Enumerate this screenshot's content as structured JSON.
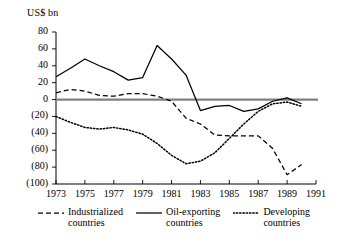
{
  "chart_data": {
    "type": "line",
    "title": "",
    "ylabel": "US$ bn",
    "xlabel": "",
    "ylim": [
      -100,
      80
    ],
    "xlim": [
      1973,
      1991
    ],
    "grid": false,
    "legend_position": "bottom",
    "yticks": [
      80,
      60,
      40,
      20,
      0,
      -20,
      -40,
      -60,
      -80,
      -100
    ],
    "ytick_labels": [
      "80",
      "60",
      "40",
      "20",
      "0",
      "(20)",
      "(40)",
      "(60)",
      "(80)",
      "(100)"
    ],
    "xticks": [
      1973,
      1975,
      1977,
      1979,
      1981,
      1983,
      1985,
      1987,
      1989,
      1991
    ],
    "xtick_labels": [
      "1973",
      "1975",
      "1977",
      "1979",
      "1981",
      "1983",
      "1985",
      "1987",
      "1989",
      "1991"
    ],
    "zero_line": 0,
    "x": [
      1973,
      1974,
      1975,
      1976,
      1977,
      1978,
      1979,
      1980,
      1981,
      1982,
      1983,
      1984,
      1985,
      1986,
      1987,
      1988,
      1989,
      1990
    ],
    "series": [
      {
        "name": "Industrialized countries",
        "style": "dashed",
        "values": [
          8,
          12,
          10,
          5,
          4,
          7,
          7,
          4,
          -2,
          -22,
          -29,
          -42,
          -43,
          -43,
          -43,
          -58,
          -89,
          -77
        ]
      },
      {
        "name": "Oil-exporting countries",
        "style": "solid",
        "values": [
          27,
          37,
          48,
          40,
          33,
          23,
          26,
          64,
          48,
          29,
          -13,
          -8,
          -7,
          -14,
          -11,
          -2,
          2,
          -5
        ]
      },
      {
        "name": "Developing countries",
        "style": "dotted",
        "values": [
          -20,
          -27,
          -33,
          -35,
          -33,
          -36,
          -41,
          -52,
          -66,
          -76,
          -73,
          -63,
          -46,
          -29,
          -14,
          -5,
          -3,
          -8
        ]
      }
    ]
  },
  "legend": {
    "items": [
      {
        "label": "Industrialized\ncountries",
        "style": "dashed"
      },
      {
        "label": "Oil-exporting\ncountries",
        "style": "solid"
      },
      {
        "label": "Developing\ncountries",
        "style": "dotted"
      }
    ]
  }
}
